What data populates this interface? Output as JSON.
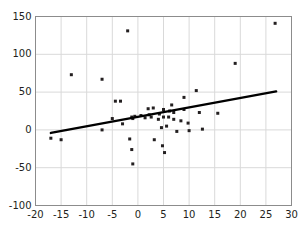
{
  "chart_data": {
    "type": "scatter",
    "title": "",
    "subtitle": "",
    "xlabel": "",
    "ylabel": "",
    "xlim": [
      -20,
      30
    ],
    "ylim": [
      -100,
      150
    ],
    "xticks": [
      -20,
      -15,
      -10,
      -5,
      0,
      5,
      10,
      15,
      20,
      25,
      30
    ],
    "yticks": [
      -100,
      -50,
      0,
      50,
      100,
      150
    ],
    "xtick_labels": [
      "-20",
      "-15",
      "-10",
      "-5",
      "0",
      "5",
      "10",
      "15",
      "20",
      "25",
      "30"
    ],
    "ytick_labels": [
      "-100",
      "-50",
      "0",
      "50",
      "100",
      "150"
    ],
    "grid": true,
    "grid_color": "#d9d9d9",
    "axis_color": "#8c8c8c",
    "legend": null,
    "marker": {
      "shape": "square",
      "color": "#231f20",
      "size": 3
    },
    "points": [
      [
        -17,
        -11
      ],
      [
        -15,
        -13
      ],
      [
        -13,
        73
      ],
      [
        -7,
        67
      ],
      [
        -7,
        0
      ],
      [
        -5,
        15
      ],
      [
        -4.4,
        38
      ],
      [
        -3.4,
        38
      ],
      [
        -3,
        8
      ],
      [
        -2,
        131
      ],
      [
        -1.6,
        -12
      ],
      [
        -1.2,
        17
      ],
      [
        -1.2,
        -26
      ],
      [
        -1,
        15
      ],
      [
        -1,
        -45
      ],
      [
        -0.6,
        18
      ],
      [
        0.6,
        19
      ],
      [
        1.4,
        16
      ],
      [
        2,
        28
      ],
      [
        2.2,
        20
      ],
      [
        2.6,
        17
      ],
      [
        3,
        29
      ],
      [
        3.2,
        -13
      ],
      [
        4,
        14
      ],
      [
        4.2,
        21
      ],
      [
        4.6,
        3
      ],
      [
        4.8,
        -21
      ],
      [
        5,
        17
      ],
      [
        5,
        27
      ],
      [
        5.2,
        -30
      ],
      [
        5.6,
        5
      ],
      [
        6,
        17
      ],
      [
        6.2,
        25
      ],
      [
        6.6,
        33
      ],
      [
        7,
        23
      ],
      [
        7,
        14
      ],
      [
        7.6,
        -2
      ],
      [
        8.4,
        12
      ],
      [
        9,
        43
      ],
      [
        9,
        27
      ],
      [
        9.8,
        9
      ],
      [
        10,
        -1
      ],
      [
        11.4,
        52
      ],
      [
        12,
        23
      ],
      [
        12.6,
        1
      ],
      [
        15.6,
        22
      ],
      [
        19,
        88
      ],
      [
        26.8,
        141
      ]
    ],
    "trendline": {
      "type": "linear",
      "color": "#000000",
      "width": 2.4,
      "x_start": -17,
      "y_start": -4,
      "x_end": 27,
      "y_end": 51,
      "slope": 1.25,
      "intercept": 17.25
    }
  }
}
